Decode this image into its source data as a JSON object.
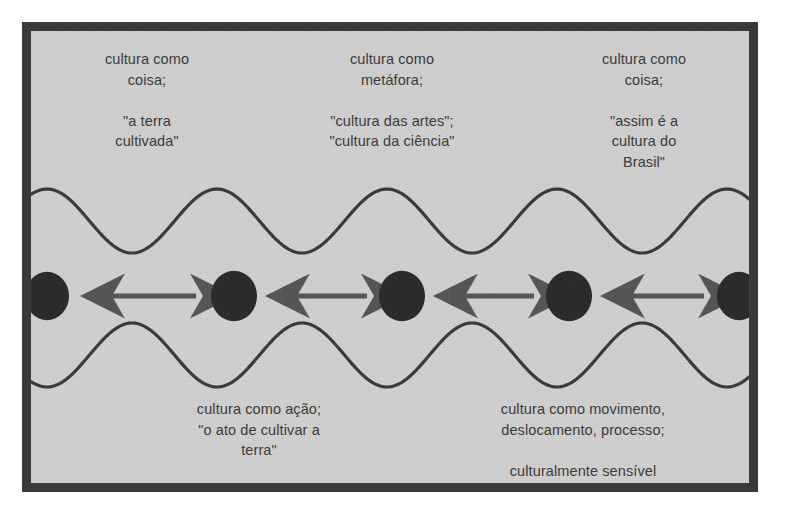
{
  "figure": {
    "background_color": "#d0d0d0",
    "border_color": "#3a3a3a",
    "page_color": "#ffffff"
  },
  "labels": {
    "top_left": "cultura como\ncoisa;\n\n\"a terra\ncultivada\"",
    "top_middle": "cultura como\nmetáfora;\n\n\"cultura das artes\";\n\"cultura da ciência\"",
    "top_right": "cultura como\ncoisa;\n\n\"assim é a\ncultura do\nBrasil\"",
    "bottom_left": "cultura como ação;\n\"o ato de cultivar a\nterra\"",
    "bottom_right": "cultura como movimento,\ndeslocamento, processo;\n\nculturalmente sensível"
  },
  "chart_data": {
    "type": "diagram",
    "title": "",
    "node_color": "#2b2b2b",
    "arrow_color": "#555555",
    "wave_color": "#3a3a3a",
    "node_count": 5,
    "nodes": [
      {
        "index": 1,
        "cx": 16,
        "cy": 265,
        "r": 22
      },
      {
        "index": 2,
        "cx": 203,
        "cy": 265,
        "r": 23
      },
      {
        "index": 3,
        "cx": 371,
        "cy": 265,
        "r": 23
      },
      {
        "index": 4,
        "cx": 538,
        "cy": 265,
        "r": 23
      },
      {
        "index": 5,
        "cx": 708,
        "cy": 265,
        "r": 22
      }
    ],
    "arrows": [
      {
        "index": 1,
        "x1": 55,
        "x2": 165,
        "y": 265,
        "double_headed": true
      },
      {
        "index": 2,
        "x1": 240,
        "x2": 336,
        "y": 265,
        "double_headed": true
      },
      {
        "index": 3,
        "x1": 408,
        "x2": 503,
        "y": 265,
        "double_headed": true
      },
      {
        "index": 4,
        "x1": 575,
        "x2": 673,
        "y": 265,
        "double_headed": true
      }
    ],
    "waves": [
      {
        "name": "upper",
        "peak_y": 158,
        "trough_y": 222,
        "wavelength": 170,
        "phase": "peak-at-node"
      },
      {
        "name": "lower",
        "peak_y": 292,
        "trough_y": 356,
        "wavelength": 170,
        "phase": "peak-at-node"
      }
    ]
  }
}
